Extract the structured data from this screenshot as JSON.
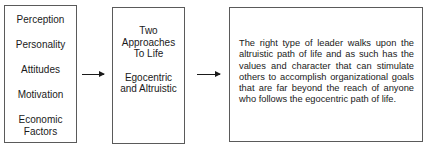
{
  "diagram": {
    "factors_box": {
      "items": [
        "Perception",
        "Personality",
        "Attitudes",
        "Motivation",
        "Economic Factors"
      ]
    },
    "approaches_box": {
      "title": "Two Approaches To Life",
      "subtitle": "Egocentric and Altruistic"
    },
    "statement_box": {
      "text": "The right type of leader walks upon the altruistic path of life and as such has the values and character that can stimulate others to accomplish organizational goals that are far beyond the reach of anyone who follows the egocentric path of life."
    },
    "connectors": [
      {
        "from": "factors_box",
        "to": "approaches_box",
        "type": "arrow-right"
      },
      {
        "from": "approaches_box",
        "to": "statement_box",
        "type": "arrow-right"
      }
    ],
    "colors": {
      "border": "#5a5a5a",
      "text": "#1a1a1a",
      "background": "#ffffff"
    }
  }
}
